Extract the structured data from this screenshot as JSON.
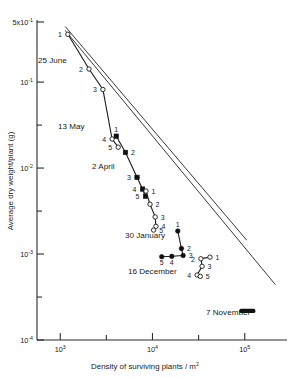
{
  "figure": {
    "name": "self-thinning-log-log-plot"
  },
  "axes": {
    "y": {
      "title": "Average dry weight/plant (g)",
      "title_parts": {
        "main": "Average dry weight/plant (g)"
      },
      "ticks": [
        {
          "label_base": "5x10",
          "label_exp": "-1",
          "value": 0.5,
          "labeled": true
        },
        {
          "label_base": "10",
          "label_exp": "-1",
          "value": 0.1,
          "labeled": true
        },
        {
          "label_base": "",
          "label_exp": "",
          "value": 0.0316,
          "labeled": false
        },
        {
          "label_base": "10",
          "label_exp": "-2",
          "value": 0.01,
          "labeled": true
        },
        {
          "label_base": "",
          "label_exp": "",
          "value": 0.00316,
          "labeled": false
        },
        {
          "label_base": "10",
          "label_exp": "-3",
          "value": 0.001,
          "labeled": true
        },
        {
          "label_base": "",
          "label_exp": "",
          "value": 0.000316,
          "labeled": false
        },
        {
          "label_base": "10",
          "label_exp": "-4",
          "value": 0.0001,
          "labeled": true
        }
      ],
      "range": [
        0.0001,
        0.5
      ],
      "scale": "log"
    },
    "x": {
      "title_pre": "Density of surviving plants /",
      "title_unit": "m",
      "title_unit_exp": "2",
      "title": "Density of surviving plants / m2",
      "ticks": [
        {
          "label_base": "10",
          "label_exp": "3",
          "value": 1000,
          "labeled": true
        },
        {
          "label_base": "",
          "label_exp": "",
          "value": 3162,
          "labeled": false
        },
        {
          "label_base": "10",
          "label_exp": "4",
          "value": 10000,
          "labeled": true
        },
        {
          "label_base": "",
          "label_exp": "",
          "value": 31620,
          "labeled": false
        },
        {
          "label_base": "10",
          "label_exp": "5",
          "value": 100000,
          "labeled": true
        }
      ],
      "range": [
        560,
        260000
      ],
      "scale": "log"
    }
  },
  "annotations": [
    {
      "id": "lab-25-june",
      "text": "25 June",
      "x": 38,
      "y": 63
    },
    {
      "id": "lab-13-may",
      "text": "13 May",
      "x": 58,
      "y": 129
    },
    {
      "id": "lab-2-april",
      "text": "2 April",
      "x": 92,
      "y": 169
    },
    {
      "id": "lab-30-january",
      "text": "30 January",
      "x": 125,
      "y": 238
    },
    {
      "id": "lab-16-december",
      "text": "16 December",
      "x": 128,
      "y": 274
    },
    {
      "id": "lab-7-november",
      "text": "7 November",
      "x": 206,
      "y": 315
    }
  ],
  "chart_data": {
    "type": "line",
    "title": "",
    "xlabel": "Density of surviving plants / m^2",
    "ylabel": "Average dry weight/plant (g)",
    "xscale": "log",
    "yscale": "log",
    "xlim": [
      560,
      260000
    ],
    "ylim": [
      0.0001,
      0.5
    ],
    "grid": false,
    "legend": "none (series labeled inline by sowing date)",
    "boundary_lines": [
      {
        "name": "upper self-thinning boundary",
        "slope_log": -1.5,
        "points": [
          [
            1130,
            0.445
          ],
          [
            105000,
            0.00145
          ]
        ]
      },
      {
        "name": "lower self-thinning boundary",
        "slope_log": -1.5,
        "points": [
          [
            1130,
            0.4
          ],
          [
            215000,
            0.00044
          ]
        ]
      }
    ],
    "series": [
      {
        "name": "25 June",
        "marker": "open-circle",
        "points": [
          {
            "label": "1",
            "x": 1210,
            "y": 0.36
          },
          {
            "label": "2",
            "x": 2050,
            "y": 0.142
          },
          {
            "label": "3",
            "x": 2900,
            "y": 0.082
          },
          {
            "label": "4",
            "x": 3650,
            "y": 0.0218
          },
          {
            "label": "5",
            "x": 4250,
            "y": 0.0175
          }
        ]
      },
      {
        "name": "13 May",
        "marker": "filled-square",
        "points": [
          {
            "label": "1",
            "x": 4050,
            "y": 0.0235
          },
          {
            "label": "2",
            "x": 5100,
            "y": 0.0152
          },
          {
            "label": "3",
            "x": 6800,
            "y": 0.0078
          },
          {
            "label": "4",
            "x": 7800,
            "y": 0.0057
          },
          {
            "label": "5",
            "x": 8400,
            "y": 0.0047
          }
        ]
      },
      {
        "name": "2 April",
        "marker": "open-circle",
        "points": [
          {
            "label": "1",
            "x": 8500,
            "y": 0.0054
          },
          {
            "label": "2",
            "x": 9400,
            "y": 0.0038
          },
          {
            "label": "3",
            "x": 10700,
            "y": 0.0027
          },
          {
            "label": "4",
            "x": 10900,
            "y": 0.0021
          },
          {
            "label": "5",
            "x": 10300,
            "y": 0.0019
          }
        ]
      },
      {
        "name": "30 January",
        "marker": "filled-circle",
        "points": [
          {
            "label": "1",
            "x": 18800,
            "y": 0.00185
          },
          {
            "label": "2",
            "x": 20600,
            "y": 0.00116
          },
          {
            "label": "3",
            "x": 21500,
            "y": 0.00096
          },
          {
            "label": "4",
            "x": 16200,
            "y": 0.00094
          },
          {
            "label": "5",
            "x": 12600,
            "y": 0.00093
          }
        ]
      },
      {
        "name": "16 December",
        "marker": "open-circle",
        "points": [
          {
            "label": "1",
            "x": 42000,
            "y": 0.00092
          },
          {
            "label": "2",
            "x": 33500,
            "y": 0.00088
          },
          {
            "label": "3",
            "x": 34500,
            "y": 0.00072
          },
          {
            "label": "4",
            "x": 30500,
            "y": 0.00057
          },
          {
            "label": "5",
            "x": 33000,
            "y": 0.00055
          }
        ]
      },
      {
        "name": "7 November",
        "marker": "filled-cluster",
        "points": [
          {
            "label": "",
            "x": 92000,
            "y": 0.000218
          },
          {
            "label": "",
            "x": 100000,
            "y": 0.000216
          },
          {
            "label": "",
            "x": 108000,
            "y": 0.000215
          },
          {
            "label": "",
            "x": 116000,
            "y": 0.000214
          },
          {
            "label": "",
            "x": 124000,
            "y": 0.000213
          }
        ]
      }
    ]
  }
}
